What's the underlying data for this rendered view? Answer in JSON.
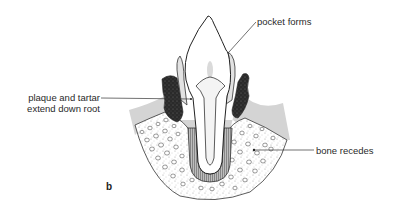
{
  "figure": {
    "panel_letter": "b",
    "labels": {
      "pocket": "pocket forms",
      "plaque_line1": "plaque and tartar",
      "plaque_line2": "extend down root",
      "bone": "bone recedes"
    },
    "colors": {
      "gum": "#d2d2d2",
      "tartar": "#2b2b2b",
      "bone_fill": "#e9e9e9",
      "tooth": "#ffffff",
      "outline": "#222222"
    }
  }
}
